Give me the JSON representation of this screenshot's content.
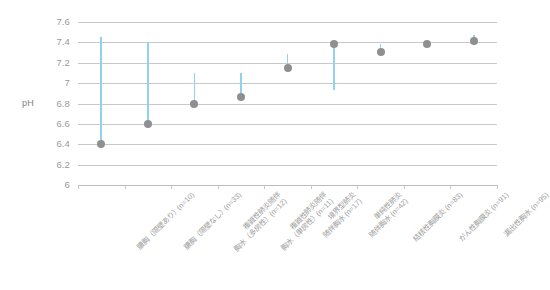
{
  "chart_data": {
    "type": "scatter",
    "title": "",
    "xlabel": "",
    "ylabel": "pH",
    "ylim": [
      6,
      7.6
    ],
    "ytick_values": [
      "7.6",
      "7.4",
      "7.2",
      "7",
      "6.8",
      "6.6",
      "6.4",
      "6.2",
      "6"
    ],
    "grid": true,
    "legend": "none",
    "categories": [
      "膿胸（隔壁あり）(n=10)",
      "膿胸（隔壁なし）(n=33)",
      "複雑性肺炎随伴胸水（多房性）(n=12)",
      "複雑性肺炎随伴胸水（単房性）(n=11)",
      "境界型肺炎随伴胸水 (n=17)",
      "単純性肺炎随伴胸水 (n=42)",
      "結核性胸膜炎 (n=83)",
      "がん性胸膜炎 (n=91)",
      "漏出性胸水 (n=95)"
    ],
    "category_lines": [
      [
        "膿胸（隔壁あり）(n=10)",
        ""
      ],
      [
        "膿胸（隔壁なし）(n=33)",
        ""
      ],
      [
        "複雑性肺炎随伴",
        "胸水（多房性）(n=12)"
      ],
      [
        "複雑性肺炎随伴",
        "胸水（単房性）(n=11)"
      ],
      [
        "境界型肺炎",
        "随伴胸水 (n=17)"
      ],
      [
        "単純性肺炎",
        "随伴胸水 (n=42)"
      ],
      [
        "結核性胸膜炎 (n=83)",
        ""
      ],
      [
        "がん性胸膜炎 (n=91)",
        ""
      ],
      [
        "漏出性胸水 (n=95)",
        ""
      ]
    ],
    "values": [
      6.4,
      6.6,
      6.8,
      6.86,
      7.15,
      7.38,
      7.31,
      7.38,
      7.41
    ],
    "whisker_high": [
      7.45,
      7.4,
      7.1,
      7.1,
      7.29,
      7.38,
      7.38,
      7.38,
      7.47
    ],
    "whisker_low": [
      6.4,
      6.6,
      6.8,
      6.86,
      7.15,
      6.93,
      7.31,
      7.38,
      7.41
    ],
    "series": [
      {
        "name": "pH",
        "values": [
          6.4,
          6.6,
          6.8,
          6.86,
          7.15,
          7.38,
          7.31,
          7.38,
          7.41
        ]
      }
    ],
    "marker_color": "#8f8f8f",
    "whisker_color": "#8ed3ef",
    "grid_color": "#c9c9c9",
    "tick_label_color": "#9a9a9a"
  }
}
